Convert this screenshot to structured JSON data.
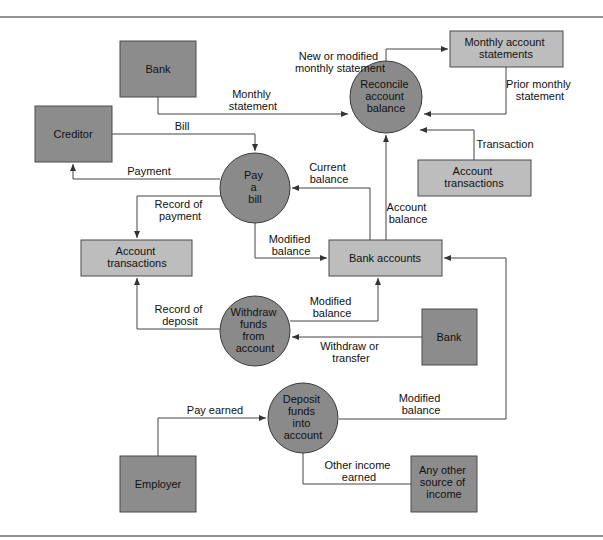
{
  "diagram": {
    "type": "data-flow-diagram",
    "colors": {
      "external_entity": "#8c8c8c",
      "data_store": "#bdbdbd",
      "process": "#8a8a8a",
      "line": "#444444"
    },
    "external_entities": {
      "bank_top": {
        "label": [
          "Bank"
        ]
      },
      "creditor": {
        "label": [
          "Creditor"
        ]
      },
      "bank_right": {
        "label": [
          "Bank"
        ]
      },
      "employer": {
        "label": [
          "Employer"
        ]
      },
      "other_source": {
        "label": [
          "Any other",
          "source of",
          "income"
        ]
      }
    },
    "processes": {
      "reconcile": {
        "label": [
          "Reconcile",
          "account",
          "balance"
        ]
      },
      "pay_bill": {
        "label": [
          "Pay",
          "a",
          "bill"
        ]
      },
      "withdraw": {
        "label": [
          "Withdraw",
          "funds",
          "from",
          "account"
        ]
      },
      "deposit": {
        "label": [
          "Deposit",
          "funds",
          "into",
          "account"
        ]
      }
    },
    "data_stores": {
      "monthly_statements": {
        "label": [
          "Monthly account",
          "statements"
        ]
      },
      "account_transactions_right": {
        "label": [
          "Account",
          "transactions"
        ]
      },
      "account_transactions_left": {
        "label": [
          "Account",
          "transactions"
        ]
      },
      "bank_accounts": {
        "label": [
          "Bank accounts"
        ]
      }
    },
    "flows": {
      "monthly_statement": {
        "label": [
          "Monthly",
          "statement"
        ]
      },
      "new_modified_statement": {
        "label": [
          "New or modified",
          "monthly statement"
        ]
      },
      "prior_statement": {
        "label": [
          "Prior monthly",
          "statement"
        ]
      },
      "transaction": {
        "label": [
          "Transaction"
        ]
      },
      "bill": {
        "label": [
          "Bill"
        ]
      },
      "payment": {
        "label": [
          "Payment"
        ]
      },
      "current_balance": {
        "label": [
          "Current",
          "balance"
        ]
      },
      "account_balance": {
        "label": [
          "Account",
          "balance"
        ]
      },
      "record_payment": {
        "label": [
          "Record of",
          "payment"
        ]
      },
      "modified_balance_pay": {
        "label": [
          "Modified",
          "balance"
        ]
      },
      "record_deposit": {
        "label": [
          "Record of",
          "deposit"
        ]
      },
      "modified_balance_withdraw": {
        "label": [
          "Modified",
          "balance"
        ]
      },
      "withdraw_transfer": {
        "label": [
          "Withdraw or",
          "transfer"
        ]
      },
      "pay_earned": {
        "label": [
          "Pay earned"
        ]
      },
      "modified_balance_deposit": {
        "label": [
          "Modified",
          "balance"
        ]
      },
      "other_income": {
        "label": [
          "Other income",
          "earned"
        ]
      }
    }
  }
}
